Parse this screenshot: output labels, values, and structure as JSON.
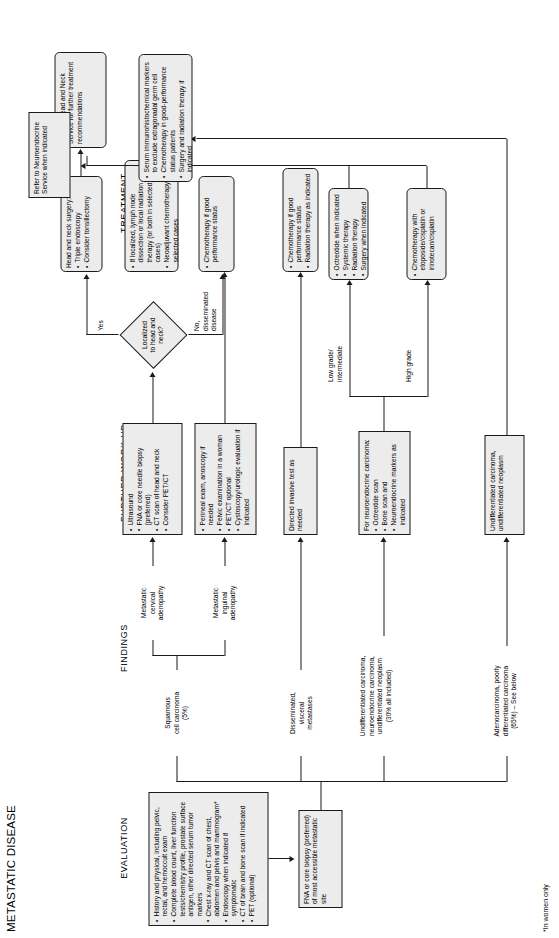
{
  "title": "METASTATIC DISEASE",
  "footnote": "*In women only",
  "columns": {
    "evaluation": "EVALUATION",
    "findings": "FINDINGS",
    "workup": "FURTHER WORK-UP",
    "treatment": "TREATMENT"
  },
  "evaluation": {
    "initial_workup": {
      "items": [
        "History and physical, including pelvic, rectal, and hemoccult exam",
        "Complete blood count, liver function tests/chemistry profile, prostate surface antigen, other directed serum tumor markers",
        "Chest x-ray and CT scan of chest, abdomen and pelvis and mammogram*",
        "Endoscopy when indicated if symptomatic",
        "CT of brain and bone scan if indicated",
        "PET (optional)"
      ]
    },
    "biopsy": {
      "text": "FNA or core biopsy (preferred) of most accessible metastatic site"
    }
  },
  "findings": {
    "squamous": "Squamous\ncell carcinoma\n(5%)",
    "cervical_adenopathy": "Metastatic\ncervical\nadenopathy",
    "inguinal_adenopathy": "Metastatic\ninguinal\nadenopathy",
    "disseminated": "Disseminated,\nvisceral\nmetastases",
    "undifferentiated": "Undifferentiated carcinoma,\nneuroendocrine carcinoma,\nundifferentiated neoplasm\n(30% all included)",
    "adenocarcinoma": "Adenocarcinoma, poorly\ndifferentiated carcinoma\n(65%) – See below"
  },
  "workup": {
    "cervical": {
      "items": [
        "Ultrasound",
        "FNA or core needle biopsy (preferred)",
        "CT scan of head and neck",
        "Consider PET/CT"
      ]
    },
    "inguinal": {
      "items": [
        "Perineal exam, anoscopy if needed",
        "Pelvic examination in a woman",
        "PET/CT optional",
        "Cystoscopy/urologic evaluation if indicated"
      ]
    },
    "disseminated": {
      "text": "Directed invasive test as needed"
    },
    "neuroendocrine": {
      "header": "For neuroendocrine carcinoma:",
      "items": [
        "Octreotide scan",
        "Bone scan and",
        "Neuroendocrine markers as indicated"
      ]
    },
    "undifferentiated_neoplasm": {
      "text": "Undifferentiated carcinoma, undifferentiated neoplasm"
    }
  },
  "decision": {
    "text": "Localized\nto head and\nneck?",
    "yes_label": "Yes",
    "no_label": "No,\ndisseminated\ndisease"
  },
  "branch_labels": {
    "low_grade": "Low grade/\nintermediate",
    "high_grade": "High grade"
  },
  "treatment": {
    "head_neck_surgery": {
      "items": [
        "Head and neck surgery:",
        "Triple endoscopy",
        "Consider tonsillectomy"
      ],
      "first_is_header": true
    },
    "chemo_good_ps": {
      "text": "Chemotherapy if good performance status"
    },
    "refer_head_neck": {
      "text": "Refer to Head and Neck Service for further treatment recommendations"
    },
    "inguinal_tx": {
      "items": [
        "If localized, lymph node dissection or local radiation therapy (or both in selected cases)",
        "Neoadjuvant chemotherapy in selected cases"
      ]
    },
    "disseminated_tx": {
      "items": [
        "Chemotherapy if good performance status",
        "Radiation therapy as indicated"
      ]
    },
    "low_grade_tx": {
      "items": [
        "Octreotide when indicated",
        "Systemic therapy",
        "Radiation therapy",
        "Surgery when indicated"
      ]
    },
    "high_grade_tx": {
      "text": "Chemotherapy with etoposide/cisplatin or irinotecan/cisplatin"
    },
    "refer_neuroendocrine": {
      "text": "Refer to Neuroendocrine Service when indicated"
    },
    "undiff_tx": {
      "items": [
        "Serum immunohistochemical markers to exclude extragonadal germ cell",
        "Chemotherapy in good-performance status patients",
        "Surgery and radiation therapy if indicated"
      ]
    }
  }
}
